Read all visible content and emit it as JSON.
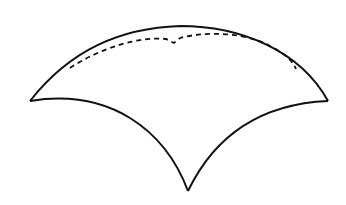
{
  "diagram": {
    "stroke_color": "#111111",
    "background_color": "#ffffff",
    "outline": {
      "left_tip": [
        30,
        101
      ],
      "right_tip": [
        328,
        101
      ],
      "bottom_tip": [
        188,
        191
      ],
      "top_apex": [
        180,
        26
      ]
    },
    "dashed_margin": {
      "start": [
        70,
        68
      ],
      "notch": [
        174,
        42
      ],
      "end": [
        296,
        69
      ]
    }
  }
}
